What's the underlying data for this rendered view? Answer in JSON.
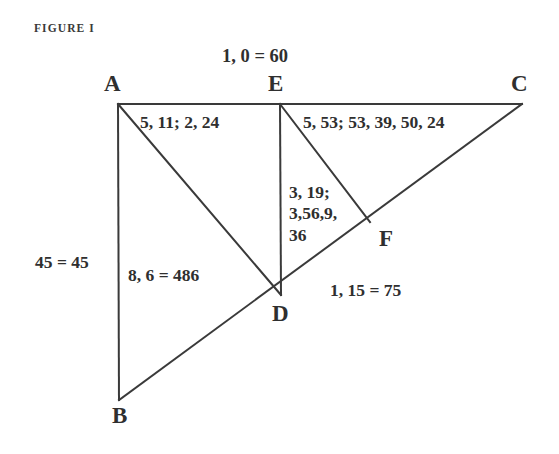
{
  "figure": {
    "caption": "FIGURE I",
    "background_color": "#ffffff",
    "ink_color": "#2f2f2f",
    "width": 559,
    "height": 454
  },
  "vertices": [
    {
      "name": "A",
      "label": "A",
      "x": 118,
      "y": 104
    },
    {
      "name": "E",
      "label": "E",
      "x": 280,
      "y": 104
    },
    {
      "name": "C",
      "label": "C",
      "x": 522,
      "y": 104
    },
    {
      "name": "F",
      "label": "F",
      "x": 370,
      "y": 222
    },
    {
      "name": "D",
      "label": "D",
      "x": 281,
      "y": 295
    },
    {
      "name": "B",
      "label": "B",
      "x": 119,
      "y": 400
    }
  ],
  "segments": [
    {
      "name": "A-C",
      "from": "A",
      "to": "C"
    },
    {
      "name": "A-B",
      "from": "A",
      "to": "B"
    },
    {
      "name": "A-D",
      "from": "A",
      "to": "D"
    },
    {
      "name": "E-D",
      "from": "E",
      "to": "D"
    },
    {
      "name": "E-F",
      "from": "E",
      "to": "F"
    },
    {
      "name": "B-C",
      "from": "B",
      "to": "C"
    }
  ],
  "annotations": {
    "top": "1, 0 = 60",
    "upper_left": "5, 11; 2, 24",
    "upper_right": "5, 53; 53, 39, 50, 24",
    "center_column": [
      "3, 19;",
      "3,56,9,",
      "36"
    ],
    "left_side": "45 = 45",
    "lower_left": "8, 6 = 486",
    "lower_right": "1, 15 = 75"
  }
}
